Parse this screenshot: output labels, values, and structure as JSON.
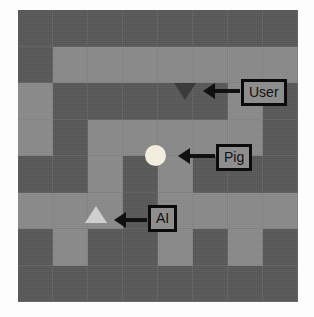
{
  "scene": {
    "title": "Gridworld maze with annotated agents",
    "grid": {
      "rows": 8,
      "cols": 8,
      "wall_color": "#595959",
      "path_color": "#8b8b8b",
      "legend": {
        "wall": "wall",
        "path": "path"
      },
      "layout": [
        [
          "wall",
          "wall",
          "wall",
          "wall",
          "wall",
          "wall",
          "wall",
          "wall"
        ],
        [
          "wall",
          "path",
          "path",
          "path",
          "path",
          "path",
          "path",
          "path"
        ],
        [
          "path",
          "wall",
          "wall",
          "wall",
          "wall",
          "wall",
          "path",
          "wall"
        ],
        [
          "path",
          "wall",
          "path",
          "path",
          "path",
          "path",
          "path",
          "wall"
        ],
        [
          "wall",
          "wall",
          "path",
          "wall",
          "path",
          "wall",
          "wall",
          "wall"
        ],
        [
          "path",
          "path",
          "path",
          "wall",
          "path",
          "path",
          "path",
          "path"
        ],
        [
          "wall",
          "path",
          "wall",
          "wall",
          "path",
          "wall",
          "path",
          "wall"
        ],
        [
          "wall",
          "wall",
          "wall",
          "wall",
          "wall",
          "wall",
          "wall",
          "wall"
        ]
      ]
    },
    "markers": [
      {
        "id": "user",
        "label": "User",
        "shape": "triangle-down",
        "color": "#3b3b3b",
        "cell": {
          "row": 2,
          "col": 4
        },
        "annotation_direction": "left"
      },
      {
        "id": "pig",
        "label": "Pig",
        "shape": "circle",
        "color": "#f2eddd",
        "cell": {
          "row": 4,
          "col": 3
        },
        "annotation_direction": "left"
      },
      {
        "id": "ai",
        "label": "AI",
        "shape": "triangle-up",
        "color": "#cfcfcf",
        "cell": {
          "row": 5,
          "col": 2
        },
        "annotation_direction": "left"
      }
    ]
  }
}
